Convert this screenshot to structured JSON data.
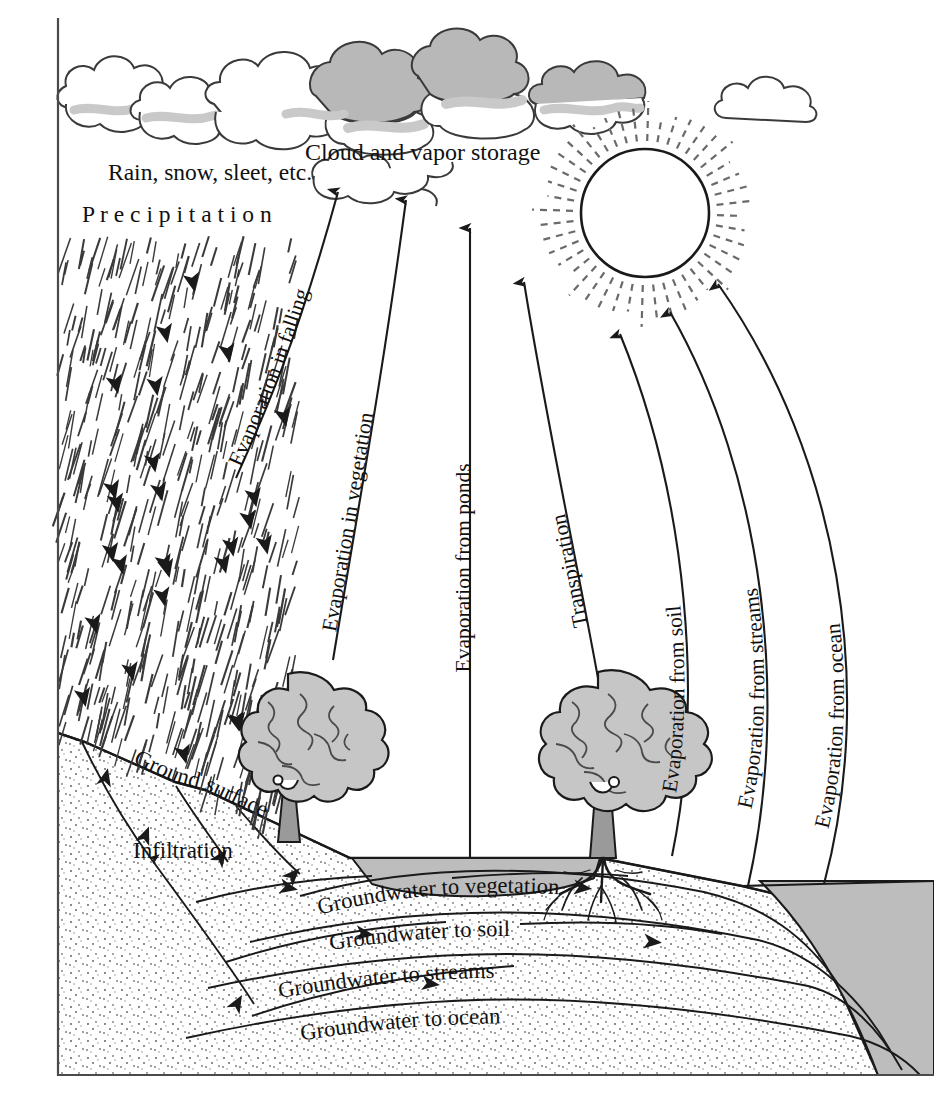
{
  "figure": {
    "frame_color": "#4a4a4a",
    "ink_color": "#1a1a1a",
    "cloud_shade_color": "#b8b8b8",
    "cloud_wisp_color": "#c9c9c9",
    "tree_foliage_color": "#c6c6c6",
    "tree_trunk_color": "#9a9a9a",
    "water_color": "#bdbdbd",
    "soil_dot_color": "#6b6b6b"
  },
  "labels": {
    "rain_types": "Rain, snow, sleet, etc.",
    "precipitation": "P r e c i p i t a t i o n",
    "cloud_storage": "Cloud and vapor storage",
    "evaporation_in_falling": "Evaporation in falling",
    "evaporation_in_vegetation": "Evaporation in vegetation",
    "evaporation_from_ponds": "Evaporation from ponds",
    "transpiration": "Transpiration",
    "evaporation_from_soil": "Evaporation from soil",
    "evaporation_from_streams": "Evaporation from streams",
    "evaporation_from_ocean": "Evaporation from ocean",
    "ground_surface": "Ground surface",
    "infiltration": "Infiltration",
    "groundwater_to_vegetation": "Groundwater to vegetation",
    "groundwater_to_soil": "Groundwater to soil",
    "groundwater_to_streams": "Groundwater to streams",
    "groundwater_to_ocean": "Groundwater to ocean"
  },
  "icons": {
    "sun": "sun-icon",
    "cloud": "cloud-icon",
    "tree": "tree-icon",
    "rain": "rain-icon",
    "arrow_up": "arrow-up-icon",
    "arrow_down": "arrow-down-icon"
  }
}
